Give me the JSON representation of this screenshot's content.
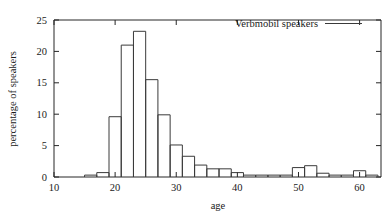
{
  "chart_data": {
    "type": "bar",
    "title": "",
    "xlabel": "age",
    "ylabel": "percentage of speakers",
    "xlim": [
      10,
      63.5
    ],
    "ylim": [
      0,
      25
    ],
    "xticks": [
      10,
      20,
      30,
      40,
      50,
      60
    ],
    "yticks": [
      0,
      5,
      10,
      15,
      20,
      25
    ],
    "grid": false,
    "legend": {
      "position": "top-right-inside",
      "entries": [
        {
          "label": "Verbmobil speakers",
          "marker": "line"
        }
      ]
    },
    "bin_width": 2,
    "bin_starts": [
      15,
      17,
      19,
      21,
      23,
      25,
      27,
      29,
      31,
      33,
      35,
      37,
      39,
      41,
      43,
      45,
      47,
      49,
      51,
      53,
      55,
      57,
      59,
      61
    ],
    "values": [
      0.3,
      0.7,
      9.6,
      21.0,
      23.2,
      15.5,
      9.9,
      5.1,
      3.3,
      1.9,
      1.3,
      1.3,
      0.7,
      0.3,
      0.3,
      0.3,
      0.3,
      1.5,
      1.8,
      0.6,
      0.3,
      0.3,
      1.0,
      0.3
    ],
    "bars": [
      {
        "x0": 15,
        "x1": 17,
        "value": 0.3
      },
      {
        "x0": 17,
        "x1": 19,
        "value": 0.7
      },
      {
        "x0": 19,
        "x1": 21,
        "value": 9.6
      },
      {
        "x0": 21,
        "x1": 23,
        "value": 21.0
      },
      {
        "x0": 23,
        "x1": 25,
        "value": 23.2
      },
      {
        "x0": 25,
        "x1": 27,
        "value": 15.5
      },
      {
        "x0": 27,
        "x1": 29,
        "value": 9.9
      },
      {
        "x0": 29,
        "x1": 31,
        "value": 5.1
      },
      {
        "x0": 31,
        "x1": 33,
        "value": 3.3
      },
      {
        "x0": 33,
        "x1": 35,
        "value": 1.9
      },
      {
        "x0": 35,
        "x1": 37,
        "value": 1.3
      },
      {
        "x0": 37,
        "x1": 39,
        "value": 1.3
      },
      {
        "x0": 39,
        "x1": 41,
        "value": 0.7
      },
      {
        "x0": 41,
        "x1": 43,
        "value": 0.3
      },
      {
        "x0": 43,
        "x1": 45,
        "value": 0.3
      },
      {
        "x0": 45,
        "x1": 47,
        "value": 0.3
      },
      {
        "x0": 47,
        "x1": 49,
        "value": 0.3
      },
      {
        "x0": 49,
        "x1": 51,
        "value": 1.5
      },
      {
        "x0": 51,
        "x1": 53,
        "value": 1.8
      },
      {
        "x0": 53,
        "x1": 55,
        "value": 0.6
      },
      {
        "x0": 55,
        "x1": 57,
        "value": 0.3
      },
      {
        "x0": 57,
        "x1": 59,
        "value": 0.3
      },
      {
        "x0": 59,
        "x1": 61,
        "value": 1.0
      },
      {
        "x0": 61,
        "x1": 63,
        "value": 0.3
      }
    ]
  },
  "style": {
    "line_color": "#3a3a3a",
    "axis_color": "#262626",
    "text_color": "#1a1a1a",
    "background": "#ffffff"
  }
}
